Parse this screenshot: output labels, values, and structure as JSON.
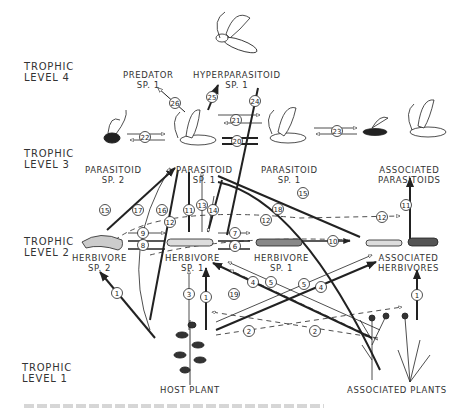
{
  "trophic_levels": [
    {
      "id": "level-4",
      "line1": "TROPHIC",
      "line2": "LEVEL 4"
    },
    {
      "id": "level-3",
      "line1": "TROPHIC",
      "line2": "LEVEL 3"
    },
    {
      "id": "level-2",
      "line1": "TROPHIC",
      "line2": "LEVEL 2"
    },
    {
      "id": "level-1",
      "line1": "TROPHIC",
      "line2": "LEVEL 1"
    }
  ],
  "nodes": {
    "predator": {
      "line1": "PREDATOR",
      "line2": "SP. 1"
    },
    "hyperparasitoid": {
      "line1": "HYPERPARASITOID",
      "line2": "SP. 1"
    },
    "parasitoid_sp2": {
      "line1": "PARASITOID",
      "line2": "SP. 2"
    },
    "parasitoid_sp1_left": {
      "line1": "PARASITOID",
      "line2": "SP. 1"
    },
    "parasitoid_sp1_right": {
      "line1": "PARASITOID",
      "line2": "SP. 1"
    },
    "associated_parasitoids": {
      "line1": "ASSOCIATED",
      "line2": "PARASITOIDS"
    },
    "herbivore_sp2": {
      "line1": "HERBIVORE",
      "line2": "SP. 2"
    },
    "herbivore_sp1_left": {
      "line1": "HERBIVORE",
      "line2": "SP. 1"
    },
    "herbivore_sp1_right": {
      "line1": "HERBIVORE",
      "line2": "SP. 1"
    },
    "associated_herbivores": {
      "line1": "ASSOCIATED",
      "line2": "HERBIVORES"
    },
    "host_plant": {
      "line1": "HOST PLANT"
    },
    "associated_plants": {
      "line1": "ASSOCIATED PLANTS"
    }
  },
  "interaction_numbers": [
    {
      "n": "1",
      "x": 117,
      "y": 293
    },
    {
      "n": "1",
      "x": 206,
      "y": 297
    },
    {
      "n": "1",
      "x": 417,
      "y": 295
    },
    {
      "n": "2",
      "x": 249,
      "y": 331
    },
    {
      "n": "2",
      "x": 315,
      "y": 331
    },
    {
      "n": "3",
      "x": 189,
      "y": 294
    },
    {
      "n": "4",
      "x": 253,
      "y": 282
    },
    {
      "n": "4",
      "x": 321,
      "y": 287
    },
    {
      "n": "5",
      "x": 271,
      "y": 282
    },
    {
      "n": "5",
      "x": 304,
      "y": 284
    },
    {
      "n": "6",
      "x": 235,
      "y": 246
    },
    {
      "n": "7",
      "x": 235,
      "y": 233
    },
    {
      "n": "8",
      "x": 143,
      "y": 245
    },
    {
      "n": "9",
      "x": 143,
      "y": 233
    },
    {
      "n": "10",
      "x": 333,
      "y": 241
    },
    {
      "n": "11",
      "x": 189,
      "y": 210
    },
    {
      "n": "11",
      "x": 406,
      "y": 205
    },
    {
      "n": "12",
      "x": 170,
      "y": 222
    },
    {
      "n": "12",
      "x": 266,
      "y": 220
    },
    {
      "n": "12",
      "x": 382,
      "y": 217
    },
    {
      "n": "13",
      "x": 202,
      "y": 205
    },
    {
      "n": "14",
      "x": 213,
      "y": 210
    },
    {
      "n": "15",
      "x": 105,
      "y": 210
    },
    {
      "n": "15",
      "x": 303,
      "y": 193
    },
    {
      "n": "16",
      "x": 162,
      "y": 210
    },
    {
      "n": "17",
      "x": 138,
      "y": 210
    },
    {
      "n": "18",
      "x": 278,
      "y": 209
    },
    {
      "n": "19",
      "x": 234,
      "y": 294
    },
    {
      "n": "20",
      "x": 237,
      "y": 141
    },
    {
      "n": "21",
      "x": 236,
      "y": 120
    },
    {
      "n": "22",
      "x": 145,
      "y": 137
    },
    {
      "n": "23",
      "x": 337,
      "y": 131
    },
    {
      "n": "24",
      "x": 255,
      "y": 101
    },
    {
      "n": "25",
      "x": 212,
      "y": 97
    },
    {
      "n": "26",
      "x": 175,
      "y": 103
    }
  ],
  "caption": ""
}
